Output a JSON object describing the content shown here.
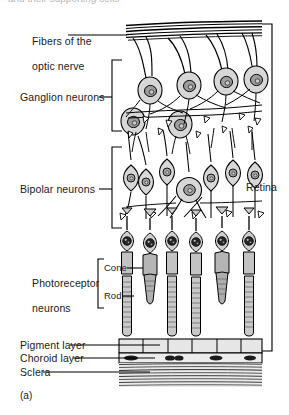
{
  "figure": {
    "caption": "(a)",
    "cropped_header_text": "and their supporting cells"
  },
  "labels": {
    "optic_nerve_fibers_line1": "Fibers of the",
    "optic_nerve_fibers_line2": "optic nerve",
    "ganglion_neurons": "Ganglion neurons",
    "bipolar_neurons": "Bipolar neurons",
    "photoreceptor_line1": "Photoreceptor",
    "photoreceptor_line2": "neurons",
    "cone": "Cone",
    "rod": "Rod",
    "pigment_layer": "Pigment layer",
    "choroid_layer": "Choroid layer",
    "sclera": "Sclera",
    "retina": "Retina"
  },
  "colors": {
    "outline": "#000000",
    "cell_body_fill": "#d7d7d7",
    "nucleus_fill": "#9a9a9a",
    "photoreceptor_nucleus": "#262626",
    "rod_fill": "#c3c3c3",
    "cone_fill": "#b5b5b5",
    "pigment_fill": "#e2e2e2",
    "choroid_fill": "#ededed",
    "sclera_fill": "#e8e8e8",
    "background": "#ffffff",
    "text": "#1a1a1a"
  },
  "structure": {
    "layers": [
      "Fibers of the optic nerve",
      "Ganglion neurons",
      "Bipolar neurons",
      "Photoreceptor neurons",
      "Pigment layer",
      "Choroid layer",
      "Sclera"
    ],
    "photoreceptor_types": [
      "Cone",
      "Rod"
    ],
    "bracketed_region": "Retina",
    "ganglion_cell_count": 4,
    "bipolar_cell_count": 7,
    "photoreceptor_count": 6,
    "nerve_fiber_line_count": 5
  }
}
